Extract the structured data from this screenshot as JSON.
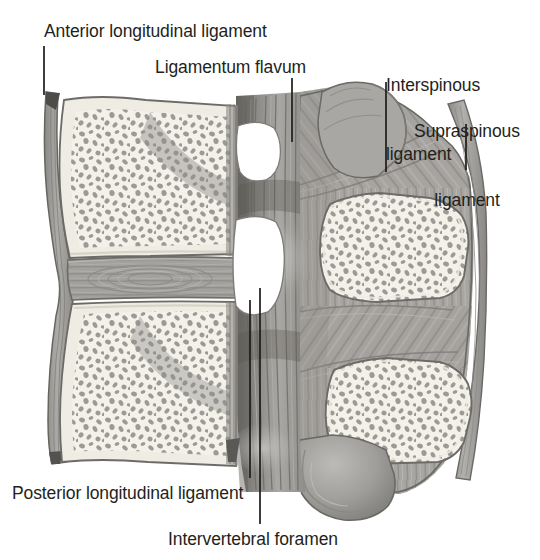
{
  "figure": {
    "type": "anatomical-illustration",
    "view": "midsagittal section, anterior to the left, posterior to the right",
    "background_color": "#ffffff",
    "ink_color": "#231f20"
  },
  "labels": [
    {
      "id": "anterior-longitudinal-ligament",
      "text": "Anterior longitudinal ligament",
      "align": "left"
    },
    {
      "id": "ligamentum-flavum",
      "text": "Ligamentum flavum",
      "align": "left"
    },
    {
      "id": "interspinous-ligament",
      "line_1": "Interspinous",
      "line_2": "ligament",
      "align": "left"
    },
    {
      "id": "supraspinous-ligament",
      "line_1": "Supraspinous",
      "line_2": "ligament",
      "align": "left"
    },
    {
      "id": "posterior-longitudinal-ligament",
      "text": "Posterior longitudinal ligament",
      "align": "left"
    },
    {
      "id": "intervertebral-foramen",
      "text": "Intervertebral foramen",
      "align": "left"
    }
  ],
  "structures": [
    {
      "id": "vertebral-body-upper",
      "name": "Upper vertebral body (cancellous bone)"
    },
    {
      "id": "vertebral-body-lower",
      "name": "Lower vertebral body (cancellous bone)"
    },
    {
      "id": "intervertebral-disc",
      "name": "Intervertebral disc"
    },
    {
      "id": "anterior-longitudinal-ligament-band",
      "name": "Anterior longitudinal ligament band"
    },
    {
      "id": "posterior-longitudinal-ligament-band",
      "name": "Posterior longitudinal ligament band"
    },
    {
      "id": "ligamentum-flavum-body",
      "name": "Ligamentum flavum"
    },
    {
      "id": "intervertebral-foramen-upper",
      "name": "Upper intervertebral foramen"
    },
    {
      "id": "intervertebral-foramen-lower",
      "name": "Lower intervertebral foramen"
    },
    {
      "id": "spinous-process-upper",
      "name": "Upper spinous process (cancellous bone)"
    },
    {
      "id": "spinous-process-lower",
      "name": "Lower spinous process (cancellous bone)"
    },
    {
      "id": "interspinous-ligament-body",
      "name": "Interspinous ligament"
    },
    {
      "id": "supraspinous-ligament-band",
      "name": "Supraspinous ligament"
    },
    {
      "id": "inferior-articular-process",
      "name": "Inferior articular process"
    }
  ],
  "palette": {
    "bone_fill": "#f2efe6",
    "bone_outline": "#6f6f6f",
    "trabecula": "#9a9a99",
    "disc_fill": "#a2a09c",
    "disc_line": "#8c8a86",
    "ligament_fill": "#9e9c98",
    "ligament_light": "#b4b2ae",
    "ligament_dark": "#7b7975",
    "flavum_dark": "#6a6864",
    "foramen_fill": "#ffffff",
    "outline": "#575757",
    "leader_line": "#1d1d1d"
  }
}
